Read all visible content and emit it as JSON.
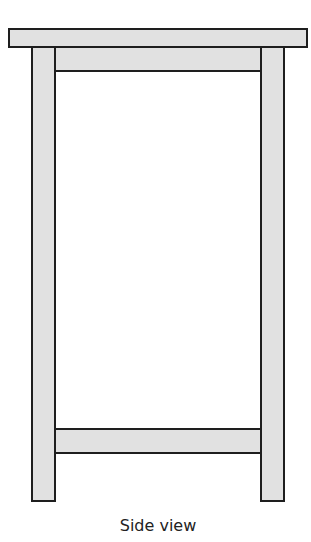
{
  "figure": {
    "caption": "Side view",
    "fill_color": "#e1e1e1",
    "stroke_color": "#1e1e1e",
    "parts": [
      "tabletop",
      "left-leg",
      "right-leg",
      "apron",
      "lower-stretcher"
    ]
  }
}
